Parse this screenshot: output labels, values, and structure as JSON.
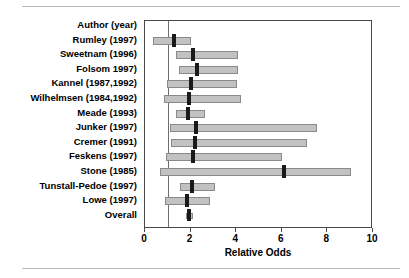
{
  "chart_data": {
    "type": "bar",
    "subtype": "forest-plot",
    "title": "",
    "xlabel": "Relative Odds",
    "ylabel": "",
    "xlim": [
      0,
      10
    ],
    "xticks": [
      0,
      2,
      4,
      6,
      8,
      10
    ],
    "xtick_labels": [
      "0",
      "2",
      "4",
      "6",
      "8",
      "10"
    ],
    "grid": false,
    "legend": false,
    "reference_line": 1,
    "header_label": "Author (year)",
    "categories": [
      "Rumley (1997)",
      "Sweetnam (1996)",
      "Folsom 1997)",
      "Kannel (1987,1992)",
      "Wilhelmsen (1984,1992)",
      "Meade (1993)",
      "Junker (1997)",
      "Cremer (1991)",
      "Feskens (1997)",
      "Stone (1985)",
      "Tunstall-Pedoe (1997)",
      "Lowe (1997)",
      "Overall"
    ],
    "studies": [
      {
        "label": "Rumley (1997)",
        "estimate": 1.25,
        "ci_low": 0.35,
        "ci_high": 2.0
      },
      {
        "label": "Sweetnam (1996)",
        "estimate": 2.1,
        "ci_low": 1.35,
        "ci_high": 4.1
      },
      {
        "label": "Folsom 1997)",
        "estimate": 2.3,
        "ci_low": 1.5,
        "ci_high": 4.1
      },
      {
        "label": "Kannel (1987,1992)",
        "estimate": 2.0,
        "ci_low": 0.95,
        "ci_high": 4.05
      },
      {
        "label": "Wilhelmsen (1984,1992)",
        "estimate": 1.95,
        "ci_low": 0.82,
        "ci_high": 4.2
      },
      {
        "label": "Meade (1993)",
        "estimate": 1.9,
        "ci_low": 1.35,
        "ci_high": 2.65
      },
      {
        "label": "Junker (1997)",
        "estimate": 2.25,
        "ci_low": 1.1,
        "ci_high": 7.55
      },
      {
        "label": "Cremer (1991)",
        "estimate": 2.2,
        "ci_low": 1.15,
        "ci_high": 7.1
      },
      {
        "label": "Feskens (1997)",
        "estimate": 2.1,
        "ci_low": 0.92,
        "ci_high": 6.0
      },
      {
        "label": "Stone (1985)",
        "estimate": 6.1,
        "ci_low": 0.65,
        "ci_high": 9.05
      },
      {
        "label": "Tunstall-Pedoe (1997)",
        "estimate": 2.05,
        "ci_low": 1.55,
        "ci_high": 3.05
      },
      {
        "label": "Lowe (1997)",
        "estimate": 1.85,
        "ci_low": 0.88,
        "ci_high": 2.85
      },
      {
        "label": "Overall",
        "estimate": 1.95,
        "ci_low": 1.82,
        "ci_high": 2.1
      }
    ]
  },
  "colors": {
    "bar_fill": "#c2c2c2",
    "bar_stroke": "#8a8a8a",
    "marker": "#1a1a1a",
    "axis": "#4a4a4a",
    "reference_line": "#6d6d6d",
    "background": "#ffffff"
  }
}
